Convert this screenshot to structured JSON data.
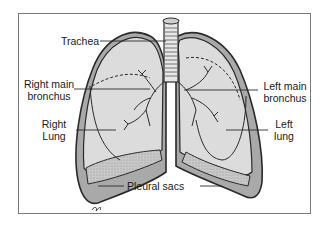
{
  "diagram": {
    "labels": {
      "trachea": "Trachea",
      "right_main_bronchus_line1": "Right main",
      "right_main_bronchus_line2": "bronchus",
      "left_main_bronchus_line1": "Left main",
      "left_main_bronchus_line2": "bronchus",
      "right_lung_line1": "Right",
      "right_lung_line2": "Lung",
      "left_lung_line1": "Left",
      "left_lung_line2": "lung",
      "pleural_sacs": "Pleural sacs"
    },
    "colors": {
      "lung_fill": "#dcdcdc",
      "pleura_fill": "#a9a9a9",
      "outline": "#2a2a2a",
      "frame": "#7a7a7a"
    },
    "signature": "artist-signature"
  }
}
